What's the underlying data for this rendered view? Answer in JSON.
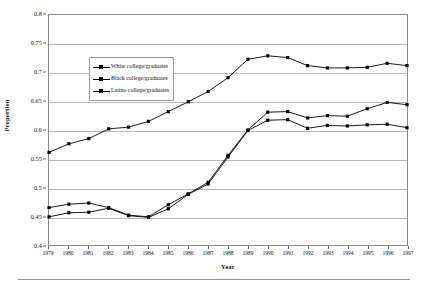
{
  "chart_data": {
    "type": "line",
    "title": "",
    "xlabel": "Year",
    "ylabel": "Proportion",
    "categories": [
      1979,
      1980,
      1981,
      1982,
      1983,
      1984,
      1985,
      1986,
      1987,
      1988,
      1989,
      1990,
      1991,
      1992,
      1993,
      1994,
      1995,
      1996,
      1997
    ],
    "x": [
      "1979",
      "1980",
      "1981",
      "1982",
      "1983",
      "1984",
      "1985",
      "1986",
      "1987",
      "1988",
      "1989",
      "1990",
      "1991",
      "1992",
      "1993",
      "1994",
      "1995",
      "1996",
      "1997"
    ],
    "xlim": [
      1979,
      1997
    ],
    "ylim": [
      0.4,
      0.8
    ],
    "yticks": [
      0.4,
      0.45,
      0.5,
      0.55,
      0.6,
      0.65,
      0.7,
      0.75,
      0.8
    ],
    "ytick_labels": [
      "0.4",
      "0.45",
      "0.5",
      "0.55",
      "0.6",
      "0.65",
      "0.7",
      "0.75",
      "0.8"
    ],
    "grid": "horizontal",
    "legend_position": "upper-left-inside",
    "marker": "filled-square",
    "line_color": "#000000",
    "series": [
      {
        "name": "White college/graduates",
        "values": [
          0.561,
          0.576,
          0.585,
          0.602,
          0.605,
          0.615,
          0.632,
          0.649,
          0.667,
          0.691,
          0.723,
          0.729,
          0.726,
          0.712,
          0.708,
          0.708,
          0.709,
          0.716,
          0.712
        ]
      },
      {
        "name": "Black college/graduates",
        "values": [
          0.449,
          0.456,
          0.457,
          0.464,
          0.451,
          0.448,
          0.463,
          0.488,
          0.506,
          0.553,
          0.599,
          0.617,
          0.618,
          0.603,
          0.608,
          0.607,
          0.609,
          0.61,
          0.604
        ]
      },
      {
        "name": "Latino college/graduates",
        "values": [
          0.465,
          0.471,
          0.473,
          0.465,
          0.452,
          0.449,
          0.47,
          0.489,
          0.509,
          0.556,
          0.6,
          0.631,
          0.632,
          0.621,
          0.625,
          0.624,
          0.637,
          0.648,
          0.644
        ]
      }
    ]
  },
  "legend": {
    "entries": [
      {
        "label": "White college/graduates"
      },
      {
        "label": "Black college/graduates"
      },
      {
        "label": "Latino college/graduates"
      }
    ]
  },
  "axes": {
    "y_title": "Proportion",
    "x_title": "Year"
  }
}
